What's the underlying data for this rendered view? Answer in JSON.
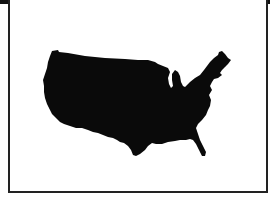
{
  "figure": {
    "fill_color": "#0a0a0a",
    "background_color": "#ffffff",
    "border_color": "#222222"
  }
}
